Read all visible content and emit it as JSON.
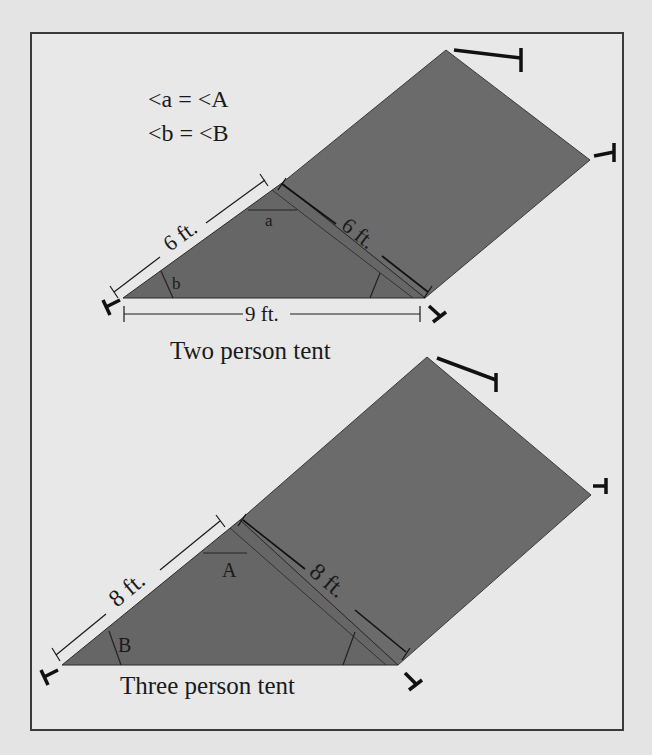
{
  "legend": {
    "line1": "<a = <A",
    "line2": "<b = <B"
  },
  "two_person_tent": {
    "caption": "Two person tent",
    "left_side_label": "6 ft.",
    "right_side_label": "6 ft.",
    "base_label": "9 ft.",
    "top_angle_label": "a",
    "left_angle_label": "b"
  },
  "three_person_tent": {
    "caption": "Three person tent",
    "left_side_label": "8 ft.",
    "right_side_label": "8 ft.",
    "top_angle_label": "A",
    "left_angle_label": "B"
  },
  "colors": {
    "tent_fill": "#6b6b6b",
    "background": "#e8e8e8",
    "line": "#1a1a1a"
  }
}
